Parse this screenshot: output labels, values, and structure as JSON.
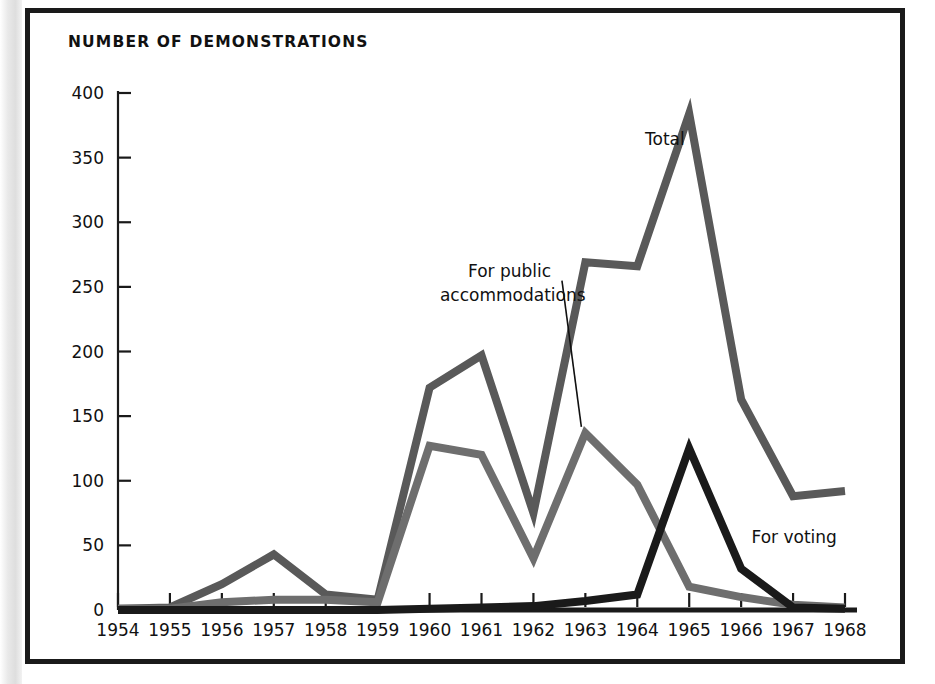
{
  "figure": {
    "title": "NUMBER OF DEMONSTRATIONS"
  },
  "chart_data": {
    "type": "line",
    "title": "NUMBER OF DEMONSTRATIONS",
    "xlabel": "",
    "ylabel": "",
    "grid": false,
    "legend_position": "inline-annotations",
    "x": [
      1954,
      1955,
      1956,
      1957,
      1958,
      1959,
      1960,
      1961,
      1962,
      1963,
      1964,
      1965,
      1966,
      1967,
      1968
    ],
    "categories": [
      "1954",
      "1955",
      "1956",
      "1957",
      "1958",
      "1959",
      "1960",
      "1961",
      "1962",
      "1963",
      "1964",
      "1965",
      "1966",
      "1967",
      "1968"
    ],
    "xlim": [
      1954,
      1968
    ],
    "ylim": [
      0,
      400
    ],
    "yticks": [
      0,
      50,
      100,
      150,
      200,
      250,
      300,
      350,
      400
    ],
    "ytick_labels": [
      "0",
      "50",
      "100",
      "150",
      "200",
      "250",
      "300",
      "350",
      "400"
    ],
    "series": [
      {
        "name": "Total",
        "color": "#595959",
        "label": "Total",
        "values": [
          1,
          2,
          20,
          43,
          12,
          8,
          172,
          197,
          75,
          269,
          266,
          384,
          163,
          88,
          92
        ]
      },
      {
        "name": "For public accommodations",
        "color": "#6e6e6e",
        "label": "For public accommodations",
        "values": [
          1,
          1,
          6,
          8,
          8,
          6,
          127,
          120,
          40,
          137,
          97,
          18,
          10,
          4,
          2
        ]
      },
      {
        "name": "For voting",
        "color": "#1a1a1a",
        "label": "For voting",
        "values": [
          0,
          0,
          0,
          0,
          0,
          0,
          1,
          2,
          3,
          7,
          12,
          125,
          32,
          2,
          1
        ]
      }
    ],
    "annotations": [
      {
        "text": "Total",
        "series": "Total",
        "x": 1964.15,
        "y": 360
      },
      {
        "text": "For public accommodations",
        "series": "For public accommodations",
        "x": 1960.2,
        "y": 258,
        "leader_to_x": 1963.0,
        "leader_to_y": 137
      },
      {
        "text": "For voting",
        "series": "For voting",
        "x": 1966.2,
        "y": 52
      }
    ]
  }
}
